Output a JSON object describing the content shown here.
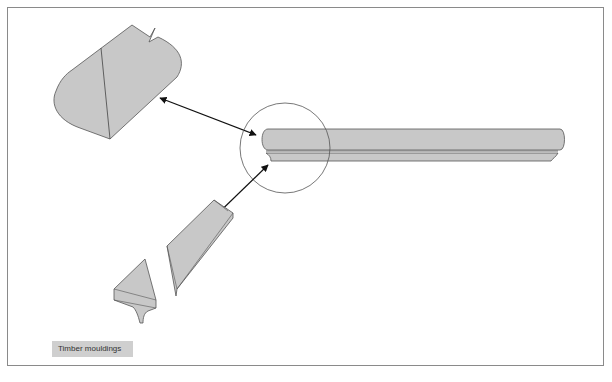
{
  "caption": "Timber mouldings",
  "colors": {
    "fill": "#c8c8c8",
    "stroke": "#555555",
    "arrow": "#111111",
    "frame": "#8a8a8a",
    "caption_bg": "#cfcfcf"
  },
  "elements": [
    {
      "name": "moulding-section-large",
      "description": "profile section of handrail moulding (top left)"
    },
    {
      "name": "moulding-strip",
      "description": "long moulding strip with rounded edge (right)"
    },
    {
      "name": "detail-circle",
      "description": "circle highlighting the end profile of the strip"
    },
    {
      "name": "moulding-piece-angled",
      "description": "angled bevelled moulding piece"
    },
    {
      "name": "moulding-piece-small",
      "description": "small triangular moulding with cove"
    }
  ]
}
